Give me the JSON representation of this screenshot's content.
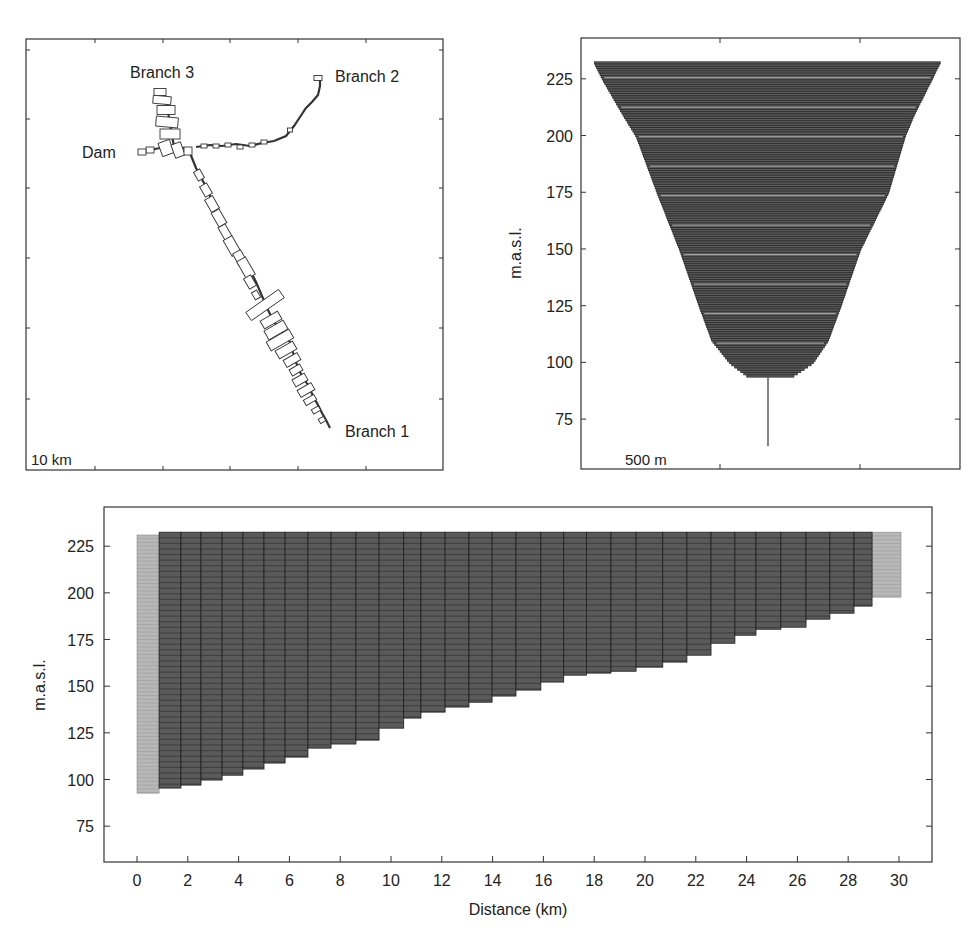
{
  "chart_data": [
    {
      "panel": "top-left",
      "type": "map",
      "title": "",
      "scale_label": "10 km",
      "annotations": [
        {
          "label": "Branch 3",
          "anchor": "upper-left arm"
        },
        {
          "label": "Branch 2",
          "anchor": "upper-right end"
        },
        {
          "label": "Dam",
          "anchor": "left of junction"
        },
        {
          "label": "Branch 1",
          "anchor": "lower-right end"
        }
      ],
      "grid": false
    },
    {
      "panel": "top-right",
      "type": "area",
      "title": "",
      "xlabel": "",
      "ylabel": "m.a.s.l.",
      "scale_label": "500 m",
      "ylim": [
        53,
        243
      ],
      "yticks": [
        75,
        100,
        125,
        150,
        175,
        200,
        225
      ],
      "ytick_labels": [
        "75",
        "100",
        "125",
        "150",
        "175",
        "200",
        "225"
      ],
      "profile": {
        "elevation": [
          232.5,
          225,
          209,
          200,
          175,
          150,
          125,
          110,
          100,
          93.5
        ],
        "left_m": [
          -620,
          -590,
          -515,
          -470,
          -395,
          -315,
          -245,
          -200,
          -135,
          -65
        ],
        "right_m": [
          615,
          585,
          520,
          490,
          430,
          330,
          260,
          215,
          160,
          80
        ]
      },
      "stem": {
        "x_m": 0,
        "from": 93.5,
        "to": 63
      },
      "grid": false
    },
    {
      "panel": "bottom",
      "type": "bar",
      "title": "",
      "xlabel": "Distance (km)",
      "ylabel": "m.a.s.l.",
      "xlim": [
        -1.3,
        31.3
      ],
      "ylim": [
        55.8,
        246
      ],
      "xticks": [
        0,
        2,
        4,
        6,
        8,
        10,
        12,
        14,
        16,
        18,
        20,
        22,
        24,
        26,
        28,
        30
      ],
      "xtick_labels": [
        "0",
        "2",
        "4",
        "6",
        "8",
        "10",
        "12",
        "14",
        "16",
        "18",
        "20",
        "22",
        "24",
        "26",
        "28",
        "30"
      ],
      "yticks": [
        75,
        100,
        125,
        150,
        175,
        200,
        225
      ],
      "ytick_labels": [
        "75",
        "100",
        "125",
        "150",
        "175",
        "200",
        "225"
      ],
      "top_elevation": 232.5,
      "light_segments": [
        {
          "x0": 0.0,
          "x1": 0.87,
          "bottom": 92.7,
          "top": 231.0
        },
        {
          "x0": 28.94,
          "x1": 30.08,
          "bottom": 197.7,
          "top": 232.5
        }
      ],
      "segments_x_edges": [
        0.87,
        1.73,
        2.52,
        3.35,
        4.17,
        5.0,
        5.83,
        6.73,
        7.64,
        8.62,
        9.53,
        10.5,
        11.18,
        12.13,
        13.07,
        13.98,
        14.92,
        15.9,
        16.8,
        17.7,
        18.66,
        19.65,
        20.7,
        21.65,
        22.6,
        23.54,
        24.37,
        25.35,
        26.34,
        27.28,
        28.23,
        28.94
      ],
      "segments_bottom": [
        95.4,
        97.0,
        99.7,
        102.3,
        105.6,
        108.8,
        112.0,
        116.8,
        119.0,
        121.1,
        127.5,
        132.9,
        136.1,
        138.8,
        141.4,
        144.7,
        147.9,
        152.2,
        155.9,
        157.0,
        158.0,
        160.2,
        162.9,
        166.6,
        173.0,
        177.3,
        180.5,
        181.6,
        185.9,
        189.1,
        192.9
      ],
      "layer_thickness_m": 1,
      "grid": false
    }
  ]
}
